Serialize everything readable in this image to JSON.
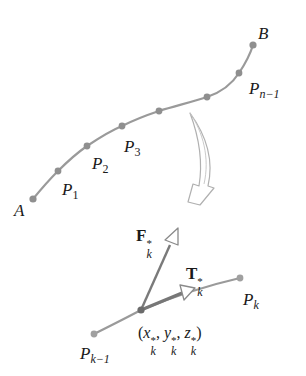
{
  "diagram": {
    "type": "curve-partition-and-tangent-detail",
    "colors": {
      "curve": "#9a9a9a",
      "point": "#8f8f8f",
      "center_point": "#6b6b6b",
      "vector": "#7a7a7a",
      "arrow_outline": "#a8a8a8",
      "text": "#1a1a1a"
    },
    "curve": {
      "start_label": "A",
      "end_label": "B",
      "points": [
        {
          "name": "A",
          "x": 33,
          "y": 199
        },
        {
          "name": "P1",
          "x": 58,
          "y": 171
        },
        {
          "name": "P2",
          "x": 87,
          "y": 146
        },
        {
          "name": "P3",
          "x": 122,
          "y": 126
        },
        {
          "name": "P4",
          "x": 159,
          "y": 111
        },
        {
          "name": "P5",
          "x": 207,
          "y": 97
        },
        {
          "name": "Pn-1",
          "x": 239,
          "y": 73
        },
        {
          "name": "B",
          "x": 253,
          "y": 45
        }
      ]
    },
    "labels": {
      "A": "A",
      "B": "B",
      "P1": {
        "base": "P",
        "sub": "1"
      },
      "P2": {
        "base": "P",
        "sub": "2"
      },
      "P3": {
        "base": "P",
        "sub": "3"
      },
      "Pn_1": {
        "base": "P",
        "sub": "n−1"
      },
      "Pk": {
        "base": "P",
        "sub": "k"
      },
      "Pk_1": {
        "base": "P",
        "sub": "k−1"
      },
      "F": {
        "base": "F",
        "sup": "*",
        "sub": "k"
      },
      "T": {
        "base": "T",
        "sup": "*",
        "sub": "k"
      },
      "sample_point": {
        "open": "(",
        "x": "x",
        "y": "y",
        "z": "z",
        "sup": "*",
        "sub": "k",
        "sep": ", ",
        "close": ")"
      }
    },
    "detail": {
      "segment_start": {
        "name": "Pk-1",
        "x": 94,
        "y": 334
      },
      "sample": {
        "name": "(xk*, yk*, zk*)",
        "x": 141,
        "y": 310
      },
      "segment_end": {
        "name": "Pk",
        "x": 240,
        "y": 278
      },
      "force_vector_tip": {
        "x": 174,
        "y": 236
      },
      "tangent_vector_tip": {
        "x": 192,
        "y": 289
      }
    },
    "transition_arrow": {
      "direction": "down",
      "meaning": "zoom into subarc"
    }
  }
}
